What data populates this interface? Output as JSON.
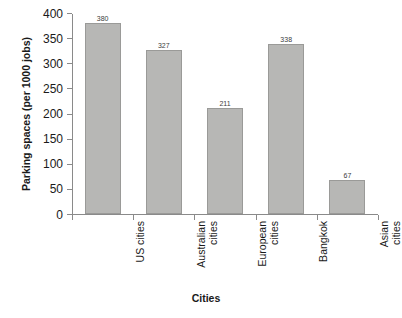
{
  "chart_data": {
    "type": "bar",
    "title": "",
    "xlabel": "Cities",
    "ylabel": "Parking spaces (per 1000 jobs)",
    "categories": [
      "US cities",
      "Australian cities",
      "European cities",
      "Bangkok",
      "Asian cities"
    ],
    "values": [
      380,
      327,
      211,
      338,
      67
    ],
    "value_labels": [
      "380",
      "327",
      "211",
      "338",
      "67"
    ],
    "ylim": [
      0,
      400
    ],
    "ytick_labels": [
      "400",
      "350",
      "300",
      "250",
      "200",
      "150",
      "100",
      "50",
      "0"
    ],
    "ytick_values": [
      400,
      350,
      300,
      250,
      200,
      150,
      100,
      50,
      0
    ],
    "grid": false,
    "legend": null,
    "bar_color": "#b7b7b5",
    "bar_border_color": "#9a9a98",
    "axis_color": "#8a8a8a"
  }
}
